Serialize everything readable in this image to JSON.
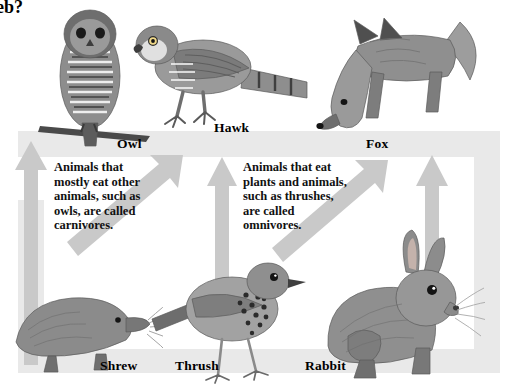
{
  "page": {
    "width": 505,
    "height": 390,
    "background": "#ffffff",
    "clipped_heading": "eb?"
  },
  "palette": {
    "band_gray": "#e9e9e9",
    "arrow_gray": "#c9c9c9",
    "arrow_gray_dark": "#bdbdbd",
    "text_black": "#111111",
    "illustration_gray": "#8a8a8a"
  },
  "info_blocks": [
    {
      "id": "carnivores",
      "text": "Animals that\nmostly eat other\nanimals, such as\nowls, are called\ncarnivores."
    },
    {
      "id": "omnivores",
      "text": "Animals that eat\nplants and animals,\nsuch as thrushes,\nare called\nomnivores."
    }
  ],
  "labels": {
    "owl": "Owl",
    "hawk": "Hawk",
    "fox": "Fox",
    "shrew": "Shrew",
    "thrush": "Thrush",
    "rabbit": "Rabbit"
  },
  "organisms": [
    {
      "name": "Owl",
      "trophic_role": "carnivore",
      "row": "top"
    },
    {
      "name": "Hawk",
      "trophic_role": "carnivore",
      "row": "top"
    },
    {
      "name": "Fox",
      "trophic_role": "omnivore",
      "row": "top"
    },
    {
      "name": "Shrew",
      "trophic_role": "carnivore",
      "row": "bottom"
    },
    {
      "name": "Thrush",
      "trophic_role": "omnivore",
      "row": "bottom"
    },
    {
      "name": "Rabbit",
      "trophic_role": "herbivore",
      "row": "bottom"
    }
  ],
  "energy_flow_arrows": [
    {
      "from": "ground",
      "to": "owl",
      "direction": "up",
      "style": "vertical"
    },
    {
      "from": "shrew",
      "to": "hawk",
      "direction": "up-right",
      "style": "diagonal"
    },
    {
      "from": "thrush",
      "to": "hawk",
      "direction": "up",
      "style": "vertical"
    },
    {
      "from": "thrush",
      "to": "fox",
      "direction": "up-right",
      "style": "diagonal"
    },
    {
      "from": "rabbit",
      "to": "fox",
      "direction": "up",
      "style": "vertical"
    }
  ]
}
